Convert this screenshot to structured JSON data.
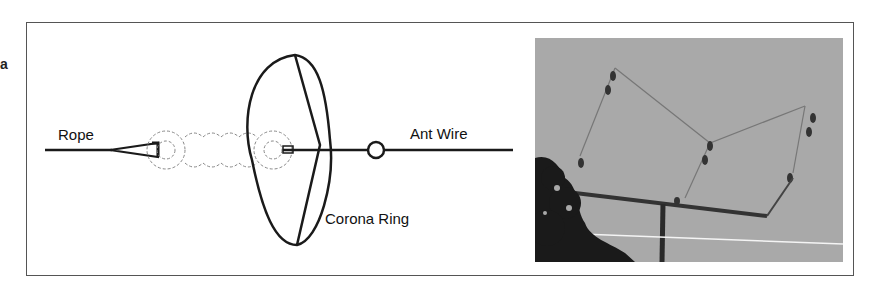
{
  "figure": {
    "side_label": "a",
    "diagram": {
      "labels": {
        "rope": "Rope",
        "ant_wire": "Ant Wire",
        "corona_ring": "Corona Ring"
      }
    },
    "photo": {
      "description": "Photograph of wire antenna with insulators suspended from a horizontal boom on a mast against a grey sky, trees at lower left"
    }
  },
  "colors": {
    "line": "#1a1a1a",
    "insulator_dashed": "#888888",
    "sky": "#a8a8a8",
    "frame": "#555555"
  }
}
